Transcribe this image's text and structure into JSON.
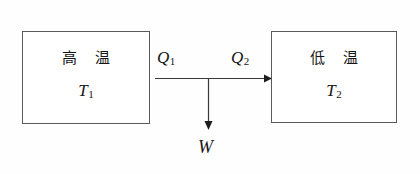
{
  "diagram": {
    "background_color": "#fefefe",
    "line_color": "#3a3a3a",
    "text_color": "#151515",
    "hot_reservoir": {
      "name": "hot-reservoir",
      "label": "高 温",
      "temperature_symbol": "T",
      "temperature_subscript": "1"
    },
    "cold_reservoir": {
      "name": "cold-reservoir",
      "label": "低 温",
      "temperature_symbol": "T",
      "temperature_subscript": "2"
    },
    "heat_in": {
      "name": "heat-absorbed",
      "symbol": "Q",
      "subscript": "1"
    },
    "heat_out": {
      "name": "heat-rejected",
      "symbol": "Q",
      "subscript": "2"
    },
    "work_out": {
      "name": "work-output",
      "symbol": "W"
    }
  }
}
